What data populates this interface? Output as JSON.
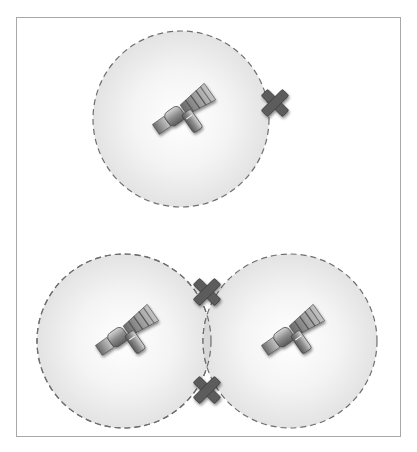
{
  "diagram": {
    "title": "Satellite coverage areas and intersection points",
    "colors": {
      "frame_border": "#a8a8a8",
      "coverage_fill_center": "#ffffff",
      "coverage_fill_edge": "#e3e3e3",
      "coverage_stroke": "#6e6e6e",
      "overlap_fill": "#d8d8d8",
      "marker_fill": "#5c5c5c",
      "marker_stroke": "#3a3a3a",
      "satellite_dark": "#555555",
      "satellite_mid": "#8a8a8a",
      "satellite_light": "#c8c8c8"
    },
    "groups": [
      {
        "label": "Single satellite",
        "satellites": [
          {
            "id": "sat-top",
            "cx": 181,
            "cy": 119,
            "r": 88
          }
        ],
        "markers": [
          {
            "id": "marker-top-right",
            "x": 275,
            "y": 103,
            "icon": "x-mark-icon"
          }
        ]
      },
      {
        "label": "Two overlapping satellites",
        "satellites": [
          {
            "id": "sat-bottom-left",
            "cx": 124,
            "cy": 341,
            "r": 87
          },
          {
            "id": "sat-bottom-right",
            "cx": 290,
            "cy": 341,
            "r": 87
          }
        ],
        "markers": [
          {
            "id": "marker-overlap-top",
            "x": 207,
            "y": 292,
            "icon": "x-mark-icon"
          },
          {
            "id": "marker-overlap-bottom",
            "x": 207,
            "y": 390,
            "icon": "x-mark-icon"
          }
        ]
      }
    ]
  }
}
